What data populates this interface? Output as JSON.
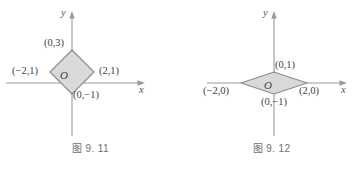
{
  "figures": [
    {
      "id": "fig-9-11",
      "caption": "图 9. 11",
      "axes": {
        "x_label": "x",
        "y_label": "y",
        "origin_label": "O"
      },
      "shape": {
        "name": "diamond",
        "fill": "#d9d9d9",
        "stroke": "#8c8c8c",
        "vertices": [
          {
            "label": "(0,3)",
            "x": 0,
            "y": 3
          },
          {
            "label": "(2,1)",
            "x": 2,
            "y": 1
          },
          {
            "label": "(0,−1)",
            "x": 0,
            "y": -1
          },
          {
            "label": "(−2,1)",
            "x": -2,
            "y": 1
          }
        ]
      }
    },
    {
      "id": "fig-9-12",
      "caption": "图 9. 12",
      "axes": {
        "x_label": "x",
        "y_label": "y",
        "origin_label": "O"
      },
      "shape": {
        "name": "diamond",
        "fill": "#d9d9d9",
        "stroke": "#8c8c8c",
        "vertices": [
          {
            "label": "(0,1)",
            "x": 0,
            "y": 1
          },
          {
            "label": "(2,0)",
            "x": 2,
            "y": 0
          },
          {
            "label": "(0,−1)",
            "x": 0,
            "y": -1
          },
          {
            "label": "(−2,0)",
            "x": -2,
            "y": 0
          }
        ]
      }
    }
  ],
  "style": {
    "axis_color": "#9a9a9a",
    "shape_fill": "#d9d9d9",
    "shape_stroke": "#8c8c8c",
    "caption_color": "#6f6f6f"
  }
}
